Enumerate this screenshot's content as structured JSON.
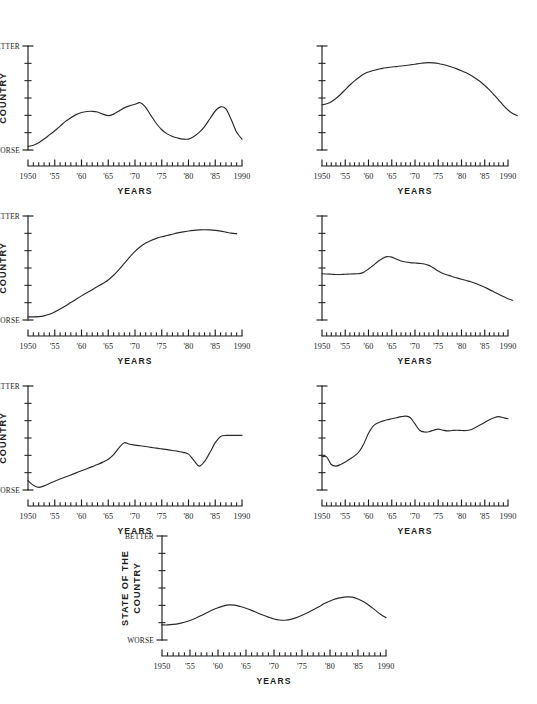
{
  "figure": {
    "background": "#ffffff",
    "ink_color": "#1d1d1d",
    "panel_count": 7
  },
  "common": {
    "x_title": "YEARS",
    "y_title_line1": "STATE OF THE",
    "y_title_line2": "COUNTRY",
    "y_top_label": "BETTER",
    "y_bottom_label": "WORSE",
    "x_tick_labels": [
      "1950",
      "'55",
      "'60",
      "'65",
      "'70",
      "'75",
      "'80",
      "'85",
      "1990"
    ],
    "x_tick_values": [
      1950,
      1955,
      1960,
      1965,
      1970,
      1975,
      1980,
      1985,
      1990
    ],
    "x_minor_step": 1,
    "y_tick_count": 7
  },
  "chart_data": [
    {
      "id": "panel-1",
      "position": "row1-left",
      "type": "line",
      "title": "",
      "xlabel": "YEARS",
      "ylabel": "STATE OF THE COUNTRY",
      "xlim": [
        1950,
        1990
      ],
      "ylim": [
        0,
        10
      ],
      "y_axis_labels": {
        "top": "BETTER",
        "bottom": "WORSE"
      },
      "grid": false,
      "legend": "none",
      "x": [
        1950,
        1951,
        1952,
        1953,
        1954,
        1955,
        1956,
        1957,
        1958,
        1959,
        1960,
        1961,
        1962,
        1963,
        1964,
        1965,
        1966,
        1967,
        1968,
        1969,
        1970,
        1971,
        1972,
        1973,
        1974,
        1975,
        1976,
        1977,
        1978,
        1979,
        1980,
        1981,
        1982,
        1983,
        1984,
        1985,
        1986,
        1987,
        1988,
        1989,
        1990
      ],
      "values": [
        0.35,
        0.45,
        0.7,
        1.05,
        1.45,
        1.85,
        2.3,
        2.75,
        3.1,
        3.4,
        3.6,
        3.7,
        3.72,
        3.65,
        3.45,
        3.3,
        3.45,
        3.75,
        4.05,
        4.25,
        4.4,
        4.55,
        4.1,
        3.3,
        2.55,
        1.95,
        1.55,
        1.3,
        1.15,
        1.05,
        1.05,
        1.3,
        1.7,
        2.25,
        3.0,
        3.75,
        4.15,
        3.95,
        2.9,
        1.7,
        1.05
      ]
    },
    {
      "id": "panel-2",
      "position": "row1-right",
      "type": "line",
      "title": "",
      "xlabel": "YEARS",
      "ylabel": "",
      "xlim": [
        1950,
        1992
      ],
      "ylim": [
        0,
        10
      ],
      "y_axis_labels": {
        "top": "",
        "bottom": ""
      },
      "grid": false,
      "legend": "none",
      "x": [
        1950,
        1951,
        1952,
        1953,
        1954,
        1955,
        1956,
        1957,
        1958,
        1959,
        1960,
        1961,
        1962,
        1963,
        1964,
        1965,
        1966,
        1967,
        1968,
        1969,
        1970,
        1971,
        1972,
        1973,
        1974,
        1975,
        1976,
        1977,
        1978,
        1979,
        1980,
        1981,
        1982,
        1983,
        1984,
        1985,
        1986,
        1987,
        1988,
        1989,
        1990,
        1991,
        1992
      ],
      "values": [
        4.35,
        4.45,
        4.65,
        4.95,
        5.35,
        5.8,
        6.25,
        6.65,
        7.0,
        7.3,
        7.5,
        7.65,
        7.75,
        7.85,
        7.92,
        7.98,
        8.02,
        8.08,
        8.12,
        8.18,
        8.25,
        8.32,
        8.38,
        8.4,
        8.38,
        8.32,
        8.22,
        8.1,
        7.96,
        7.8,
        7.62,
        7.42,
        7.18,
        6.9,
        6.58,
        6.2,
        5.78,
        5.3,
        4.8,
        4.3,
        3.85,
        3.5,
        3.3
      ]
    },
    {
      "id": "panel-3",
      "position": "row2-left",
      "type": "line",
      "title": "",
      "xlabel": "YEARS",
      "ylabel": "STATE OF THE COUNTRY",
      "xlim": [
        1950,
        1989
      ],
      "ylim": [
        0,
        10
      ],
      "y_axis_labels": {
        "top": "BETTER",
        "bottom": "WORSE"
      },
      "grid": false,
      "legend": "none",
      "x": [
        1950,
        1951,
        1952,
        1953,
        1954,
        1955,
        1956,
        1957,
        1958,
        1959,
        1960,
        1961,
        1962,
        1963,
        1964,
        1965,
        1966,
        1967,
        1968,
        1969,
        1970,
        1971,
        1972,
        1973,
        1974,
        1975,
        1976,
        1977,
        1978,
        1979,
        1980,
        1981,
        1982,
        1983,
        1984,
        1985,
        1986,
        1987,
        1988,
        1989
      ],
      "values": [
        0.3,
        0.3,
        0.32,
        0.4,
        0.55,
        0.78,
        1.05,
        1.35,
        1.68,
        2.0,
        2.32,
        2.62,
        2.92,
        3.22,
        3.52,
        3.85,
        4.3,
        4.85,
        5.45,
        6.05,
        6.6,
        7.05,
        7.4,
        7.65,
        7.85,
        8.0,
        8.12,
        8.25,
        8.38,
        8.48,
        8.56,
        8.62,
        8.66,
        8.68,
        8.66,
        8.62,
        8.55,
        8.45,
        8.35,
        8.3
      ]
    },
    {
      "id": "panel-4",
      "position": "row2-right",
      "type": "line",
      "title": "",
      "xlabel": "YEARS",
      "ylabel": "",
      "xlim": [
        1950,
        1991
      ],
      "ylim": [
        0,
        10
      ],
      "y_axis_labels": {
        "top": "",
        "bottom": ""
      },
      "grid": false,
      "legend": "none",
      "x": [
        1950,
        1951,
        1952,
        1953,
        1954,
        1955,
        1956,
        1957,
        1958,
        1959,
        1960,
        1961,
        1962,
        1963,
        1964,
        1965,
        1966,
        1967,
        1968,
        1969,
        1970,
        1971,
        1972,
        1973,
        1974,
        1975,
        1976,
        1977,
        1978,
        1979,
        1980,
        1981,
        1982,
        1983,
        1984,
        1985,
        1986,
        1987,
        1988,
        1989,
        1990,
        1991
      ],
      "values": [
        4.45,
        4.42,
        4.4,
        4.38,
        4.38,
        4.4,
        4.42,
        4.44,
        4.46,
        4.6,
        4.9,
        5.25,
        5.62,
        5.92,
        6.1,
        6.05,
        5.85,
        5.68,
        5.58,
        5.52,
        5.48,
        5.44,
        5.38,
        5.25,
        5.0,
        4.7,
        4.48,
        4.32,
        4.18,
        4.05,
        3.92,
        3.8,
        3.68,
        3.52,
        3.35,
        3.15,
        2.92,
        2.7,
        2.48,
        2.25,
        2.05,
        1.9
      ]
    },
    {
      "id": "panel-5",
      "position": "row3-left",
      "type": "line",
      "title": "",
      "xlabel": "YEARS",
      "ylabel": "STATE OF THE COUNTRY",
      "xlim": [
        1950,
        1990
      ],
      "ylim": [
        0,
        10
      ],
      "y_axis_labels": {
        "top": "BETTER",
        "bottom": "WORSE"
      },
      "grid": false,
      "legend": "none",
      "x": [
        1950,
        1951,
        1952,
        1953,
        1954,
        1955,
        1956,
        1957,
        1958,
        1959,
        1960,
        1961,
        1962,
        1963,
        1964,
        1965,
        1966,
        1967,
        1968,
        1969,
        1970,
        1971,
        1972,
        1973,
        1974,
        1975,
        1976,
        1977,
        1978,
        1979,
        1980,
        1981,
        1982,
        1983,
        1984,
        1985,
        1986,
        1987,
        1988,
        1989,
        1990
      ],
      "values": [
        0.9,
        0.45,
        0.25,
        0.4,
        0.62,
        0.85,
        1.05,
        1.25,
        1.45,
        1.65,
        1.85,
        2.05,
        2.25,
        2.45,
        2.68,
        2.95,
        3.4,
        4.05,
        4.55,
        4.4,
        4.32,
        4.25,
        4.18,
        4.1,
        4.02,
        3.95,
        3.88,
        3.8,
        3.72,
        3.62,
        3.45,
        2.85,
        2.3,
        2.75,
        3.6,
        4.55,
        5.15,
        5.25,
        5.25,
        5.25,
        5.25
      ]
    },
    {
      "id": "panel-6",
      "position": "row3-right",
      "type": "line",
      "title": "",
      "xlabel": "YEARS",
      "ylabel": "",
      "xlim": [
        1950,
        1990
      ],
      "ylim": [
        0,
        10
      ],
      "y_axis_labels": {
        "top": "",
        "bottom": ""
      },
      "grid": false,
      "legend": "none",
      "x": [
        1950,
        1951,
        1952,
        1953,
        1954,
        1955,
        1956,
        1957,
        1958,
        1959,
        1960,
        1961,
        1962,
        1963,
        1964,
        1965,
        1966,
        1967,
        1968,
        1969,
        1970,
        1971,
        1972,
        1973,
        1974,
        1975,
        1976,
        1977,
        1978,
        1979,
        1980,
        1981,
        1982,
        1983,
        1984,
        1985,
        1986,
        1987,
        1988,
        1989,
        1990
      ],
      "values": [
        3.2,
        3.18,
        2.45,
        2.3,
        2.45,
        2.7,
        2.98,
        3.28,
        3.7,
        4.45,
        5.45,
        6.15,
        6.45,
        6.62,
        6.75,
        6.85,
        6.95,
        7.05,
        7.1,
        6.95,
        6.35,
        5.75,
        5.58,
        5.6,
        5.75,
        5.85,
        5.75,
        5.68,
        5.72,
        5.75,
        5.72,
        5.72,
        5.8,
        6.0,
        6.25,
        6.5,
        6.75,
        6.95,
        7.05,
        6.95,
        6.85
      ]
    },
    {
      "id": "panel-7",
      "position": "row4-center",
      "type": "line",
      "title": "",
      "xlabel": "YEARS",
      "ylabel": "STATE OF THE COUNTRY",
      "xlim": [
        1950,
        1990
      ],
      "ylim": [
        0,
        10
      ],
      "y_axis_labels": {
        "top": "BETTER",
        "bottom": "WORSE"
      },
      "grid": false,
      "legend": "none",
      "x": [
        1950,
        1951,
        1952,
        1953,
        1954,
        1955,
        1956,
        1957,
        1958,
        1959,
        1960,
        1961,
        1962,
        1963,
        1964,
        1965,
        1966,
        1967,
        1968,
        1969,
        1970,
        1971,
        1972,
        1973,
        1974,
        1975,
        1976,
        1977,
        1978,
        1979,
        1980,
        1981,
        1982,
        1983,
        1984,
        1985,
        1986,
        1987,
        1988,
        1989,
        1990
      ],
      "values": [
        1.45,
        1.45,
        1.5,
        1.58,
        1.7,
        1.88,
        2.1,
        2.35,
        2.62,
        2.88,
        3.1,
        3.28,
        3.38,
        3.35,
        3.22,
        3.05,
        2.85,
        2.62,
        2.4,
        2.2,
        2.02,
        1.92,
        1.9,
        1.98,
        2.15,
        2.38,
        2.62,
        2.9,
        3.2,
        3.5,
        3.75,
        3.95,
        4.08,
        4.15,
        4.12,
        3.95,
        3.68,
        3.32,
        2.9,
        2.48,
        2.15
      ]
    }
  ]
}
